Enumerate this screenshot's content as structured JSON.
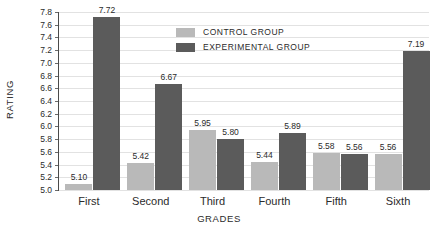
{
  "chart_data": {
    "type": "bar",
    "title": "",
    "xlabel": "GRADES",
    "ylabel": "RATING",
    "categories": [
      "First",
      "Second",
      "Third",
      "Fourth",
      "Fifth",
      "Sixth"
    ],
    "series": [
      {
        "name": "CONTROL GROUP",
        "color": "#b9b9b9",
        "values": [
          5.1,
          5.42,
          5.95,
          5.44,
          5.58,
          5.56
        ],
        "labels": [
          "5.10",
          "5.42",
          "5.95",
          "5.44",
          "5.58",
          "5.56"
        ]
      },
      {
        "name": "EXPERIMENTAL GROUP",
        "color": "#5b5b5b",
        "values": [
          7.72,
          6.67,
          5.8,
          5.89,
          5.56,
          7.19
        ],
        "labels": [
          "7.72",
          "6.67",
          "5.80",
          "5.89",
          "5.56",
          "7.19"
        ]
      }
    ],
    "ylim": [
      5.0,
      7.8
    ],
    "ytick_step": 0.2,
    "ytick_labels": [
      "5.0",
      "5.2",
      "5.4",
      "5.6",
      "5.8",
      "6.0",
      "6.2",
      "6.4",
      "6.6",
      "6.8",
      "7.0",
      "7.2",
      "7.4",
      "7.6",
      "7.8"
    ],
    "grid": true,
    "legend_position": "top-center"
  }
}
